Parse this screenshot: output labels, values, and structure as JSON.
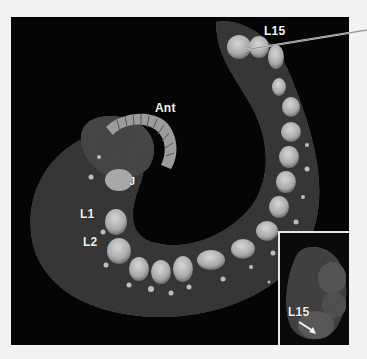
{
  "figure": {
    "labels": {
      "antenna": "Ant",
      "j": "J",
      "leg1": "L1",
      "leg2": "L2",
      "leg15_main": "L15",
      "leg15_inset": "L15"
    },
    "colors": {
      "background": "#050505",
      "page": "#f2f2f0",
      "label_text": "#f4f4f4",
      "inset_border": "#e8e8e8"
    }
  }
}
